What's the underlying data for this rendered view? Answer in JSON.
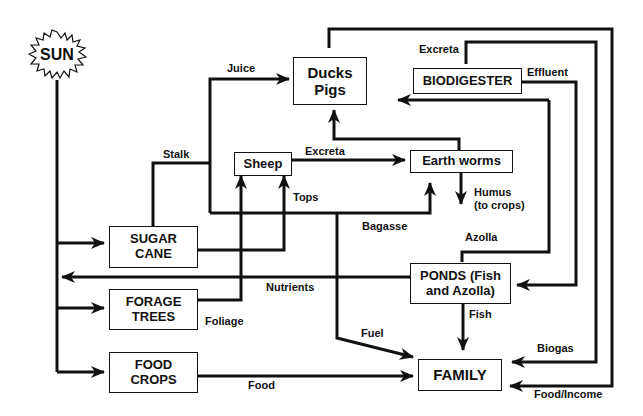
{
  "source": {
    "label": "SUN"
  },
  "nodes": {
    "ducks_pigs": "Ducks\nPigs",
    "biodigester": "BIODIGESTER",
    "sheep": "Sheep",
    "earth_worms": "Earth worms",
    "sugar_cane": "SUGAR\nCANE",
    "forage_trees": "FORAGE\nTREES",
    "food_crops": "FOOD\nCROPS",
    "ponds": "PONDS (Fish\nand Azolla)",
    "family": "FAMILY"
  },
  "flows": {
    "juice": "Juice",
    "stalk": "Stalk",
    "excreta_sheep": "Excreta",
    "excreta_ducks": "Excreta",
    "effluent": "Effluent",
    "tops": "Tops",
    "humus": "Humus\n(to crops)",
    "bagasse": "Bagasse",
    "azolla": "Azolla",
    "nutrients": "Nutrients",
    "foliage": "Foliage",
    "fuel": "Fuel",
    "fish": "Fish",
    "biogas": "Biogas",
    "food": "Food",
    "food_income": "Food/Income"
  },
  "colors": {
    "line": "#111111",
    "background": "#ffffff"
  }
}
